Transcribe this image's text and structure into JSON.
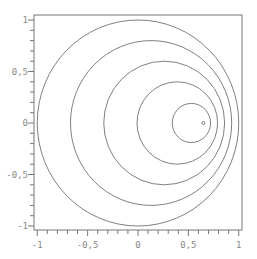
{
  "chart_data": {
    "type": "line",
    "title": "",
    "xlabel": "",
    "ylabel": "",
    "xlim": [
      -1,
      1
    ],
    "ylim": [
      -1,
      1
    ],
    "grid": false,
    "legend": null,
    "x_ticks": [
      {
        "value": -1,
        "label": "-1"
      },
      {
        "value": -0.5,
        "label": "-0,5"
      },
      {
        "value": 0,
        "label": "0"
      },
      {
        "value": 0.5,
        "label": "0,5"
      },
      {
        "value": 1,
        "label": "1"
      }
    ],
    "y_ticks": [
      {
        "value": 1,
        "label": "1"
      },
      {
        "value": 0.5,
        "label": "0,5"
      },
      {
        "value": 0,
        "label": "0"
      },
      {
        "value": -0.5,
        "label": "-0,5"
      },
      {
        "value": -1,
        "label": "-1"
      }
    ],
    "minor_tick_step": 0.1,
    "series": [
      {
        "name": "circle-1",
        "cx": 0.0,
        "cy": 0.0,
        "r": 1.0
      },
      {
        "name": "circle-2",
        "cx": 0.13,
        "cy": 0.0,
        "r": 0.8
      },
      {
        "name": "circle-3",
        "cx": 0.26,
        "cy": 0.0,
        "r": 0.6
      },
      {
        "name": "circle-4",
        "cx": 0.39,
        "cy": 0.0,
        "r": 0.4
      },
      {
        "name": "circle-5",
        "cx": 0.53,
        "cy": 0.0,
        "r": 0.19
      },
      {
        "name": "circle-6",
        "cx": 0.65,
        "cy": 0.0,
        "r": 0.015
      }
    ]
  },
  "style": {
    "line_color": "#808080",
    "frame_color": "#777777",
    "label_color": "#888888"
  }
}
